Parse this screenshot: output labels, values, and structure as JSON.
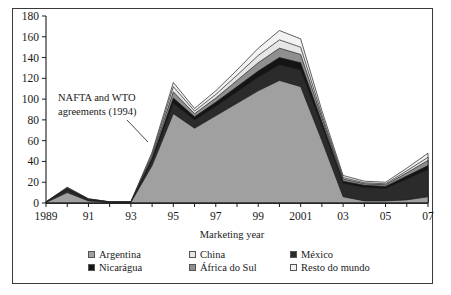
{
  "chart_data": {
    "type": "area",
    "stacked": true,
    "title": "",
    "xlabel": "Marketing year",
    "ylabel": "",
    "ylim": [
      0,
      180
    ],
    "ytick_step": 20,
    "yticks": [
      0,
      20,
      40,
      60,
      80,
      100,
      120,
      140,
      160,
      180
    ],
    "x": [
      1989,
      1990,
      1991,
      1992,
      1993,
      1994,
      1995,
      1996,
      1997,
      1998,
      1999,
      2000,
      2001,
      2002,
      2003,
      2004,
      2005,
      2006,
      2007
    ],
    "xtick_labels": [
      "1989",
      "",
      "91",
      "",
      "93",
      "",
      "95",
      "",
      "97",
      "",
      "99",
      "",
      "2001",
      "",
      "03",
      "",
      "05",
      "",
      "07"
    ],
    "grid": false,
    "legend_position": "bottom",
    "series": [
      {
        "name": "Argentina",
        "color": "#a0a0a0",
        "values": [
          0.5,
          10.0,
          2.0,
          0.5,
          0.5,
          36.0,
          86.0,
          72.0,
          84.0,
          96.0,
          108.0,
          118.0,
          112.0,
          60.0,
          6.0,
          2.0,
          2.0,
          3.0,
          6.0
        ]
      },
      {
        "name": "México",
        "color": "#2b2b2b",
        "values": [
          0.3,
          3.0,
          1.0,
          0.3,
          0.3,
          5.0,
          10.0,
          8.0,
          9.0,
          11.0,
          13.0,
          15.0,
          16.0,
          14.0,
          13.0,
          13.0,
          12.0,
          20.0,
          26.0
        ]
      },
      {
        "name": "Nicarágua",
        "color": "#141414",
        "values": [
          0.1,
          1.0,
          0.4,
          0.1,
          0.1,
          2.0,
          5.0,
          3.0,
          4.0,
          5.0,
          6.0,
          7.0,
          7.0,
          4.0,
          2.0,
          2.0,
          2.0,
          3.0,
          4.0
        ]
      },
      {
        "name": "África do Sul",
        "color": "#8f8f8f",
        "values": [
          0.1,
          0.5,
          0.3,
          0.1,
          0.1,
          2.0,
          6.0,
          3.0,
          4.0,
          6.0,
          8.0,
          9.0,
          8.0,
          4.0,
          2.0,
          1.5,
          1.5,
          3.0,
          5.0
        ]
      },
      {
        "name": "China",
        "color": "#e6e6e6",
        "values": [
          0.1,
          0.3,
          0.2,
          0.1,
          0.1,
          2.0,
          5.0,
          2.5,
          3.5,
          5.0,
          7.0,
          8.0,
          7.0,
          3.0,
          1.5,
          1.0,
          1.0,
          2.0,
          3.0
        ]
      },
      {
        "name": "Resto do mundo",
        "color": "#f2f2f2",
        "values": [
          0.1,
          0.4,
          0.2,
          0.1,
          0.1,
          2.0,
          4.0,
          2.5,
          3.5,
          5.0,
          7.0,
          9.0,
          8.0,
          4.0,
          2.0,
          1.5,
          1.5,
          2.5,
          4.0
        ]
      }
    ],
    "annotations": [
      {
        "name": "nafta-wto-annotation",
        "line1": "NAFTA and WTO",
        "line2": "agreements (1994)",
        "x": 1994
      }
    ]
  },
  "legend": {
    "rows": [
      [
        {
          "label": "Argentina",
          "color": "#a0a0a0"
        },
        {
          "label": "China",
          "color": "#e6e6e6"
        },
        {
          "label": "México",
          "color": "#2b2b2b"
        }
      ],
      [
        {
          "label": "Nicarágua",
          "color": "#141414"
        },
        {
          "label": "África do Sul",
          "color": "#8f8f8f"
        },
        {
          "label": "Resto do mundo",
          "color": "#f2f2f2"
        }
      ]
    ]
  }
}
